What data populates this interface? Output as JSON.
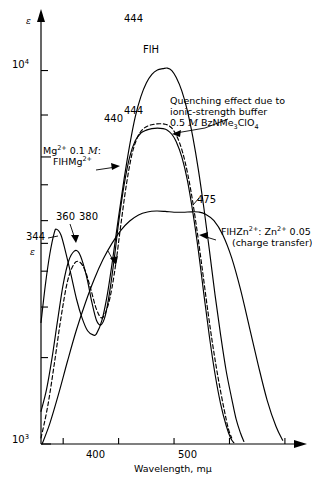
{
  "chart_data": {
    "type": "line",
    "title": "",
    "xlabel": "Wavelength, mμ",
    "ylabel": "ε",
    "scale_y": "log",
    "xlim": [
      330,
      560
    ],
    "ylim": [
      1000,
      30000
    ],
    "grid": false,
    "legend_position": "inline-annotations",
    "x_ticks": [
      350,
      400,
      450,
      500,
      550
    ],
    "x_tick_labels": [
      "",
      "400",
      "",
      "500",
      ""
    ],
    "y_ticks": [
      1000,
      2000,
      3000,
      4000,
      5000,
      6000,
      8000,
      10000,
      14000,
      20000
    ],
    "y_tick_labels": [
      "10³",
      "",
      "",
      "",
      "",
      "",
      "",
      "10⁴",
      "",
      ""
    ],
    "y_axis_top_symbol": "ε",
    "y_label_10_4": "10",
    "y_label_10_4_exp": "4",
    "y_label_10_3": "10",
    "y_label_10_3_exp": "3",
    "series": [
      {
        "name": "FlH",
        "style": "solid",
        "peaks": [
          {
            "label": "344",
            "x": 344,
            "y": 5600
          },
          {
            "label": "444",
            "x": 444,
            "y": 20000
          }
        ],
        "points": [
          [
            330,
            2650
          ],
          [
            334,
            3600
          ],
          [
            338,
            4600
          ],
          [
            342,
            5450
          ],
          [
            344,
            5600
          ],
          [
            348,
            5350
          ],
          [
            352,
            4700
          ],
          [
            357,
            3900
          ],
          [
            362,
            3200
          ],
          [
            367,
            2750
          ],
          [
            372,
            2480
          ],
          [
            377,
            2400
          ],
          [
            380,
            2420
          ],
          [
            385,
            2700
          ],
          [
            390,
            3350
          ],
          [
            395,
            4500
          ],
          [
            400,
            6200
          ],
          [
            405,
            8400
          ],
          [
            410,
            11000
          ],
          [
            415,
            13800
          ],
          [
            420,
            16200
          ],
          [
            425,
            18100
          ],
          [
            430,
            19400
          ],
          [
            435,
            20100
          ],
          [
            440,
            20300
          ],
          [
            444,
            20400
          ],
          [
            448,
            20000
          ],
          [
            452,
            18900
          ],
          [
            457,
            17000
          ],
          [
            462,
            14500
          ],
          [
            467,
            11700
          ],
          [
            472,
            9000
          ],
          [
            477,
            6600
          ],
          [
            482,
            4700
          ],
          [
            487,
            3300
          ],
          [
            492,
            2400
          ],
          [
            497,
            1800
          ],
          [
            502,
            1440
          ],
          [
            506,
            1220
          ],
          [
            510,
            1090
          ],
          [
            513,
            1020
          ]
        ]
      },
      {
        "name": "FlHMg2+",
        "style": "solid",
        "peaks": [
          {
            "label": "360",
            "x": 360,
            "y": 4700
          },
          {
            "label": "380",
            "x": 380,
            "y": 4300
          },
          {
            "label": "440",
            "x": 440,
            "y": 12200
          }
        ],
        "points": [
          [
            330,
            1300
          ],
          [
            335,
            1550
          ],
          [
            340,
            2000
          ],
          [
            345,
            2700
          ],
          [
            350,
            3600
          ],
          [
            355,
            4350
          ],
          [
            360,
            4700
          ],
          [
            364,
            4650
          ],
          [
            368,
            4250
          ],
          [
            372,
            3700
          ],
          [
            376,
            3100
          ],
          [
            380,
            2700
          ],
          [
            384,
            2600
          ],
          [
            388,
            2800
          ],
          [
            392,
            3400
          ],
          [
            396,
            4400
          ],
          [
            400,
            5900
          ],
          [
            405,
            8000
          ],
          [
            410,
            10000
          ],
          [
            415,
            11400
          ],
          [
            420,
            12100
          ],
          [
            425,
            12400
          ],
          [
            430,
            12550
          ],
          [
            435,
            12600
          ],
          [
            440,
            12550
          ],
          [
            444,
            12400
          ],
          [
            448,
            12000
          ],
          [
            452,
            11300
          ],
          [
            457,
            10000
          ],
          [
            462,
            8300
          ],
          [
            467,
            6400
          ],
          [
            472,
            4700
          ],
          [
            477,
            3300
          ],
          [
            482,
            2350
          ],
          [
            487,
            1750
          ],
          [
            492,
            1380
          ],
          [
            497,
            1160
          ],
          [
            501,
            1050
          ],
          [
            504,
            1010
          ]
        ]
      },
      {
        "name": "Quenched (ionic-strength buffer)",
        "style": "dashed",
        "peaks": [
          {
            "label": "444",
            "x": 444,
            "y": 12800
          }
        ],
        "points": [
          [
            330,
            1050
          ],
          [
            336,
            1350
          ],
          [
            342,
            1900
          ],
          [
            348,
            2750
          ],
          [
            354,
            3700
          ],
          [
            360,
            4250
          ],
          [
            365,
            4300
          ],
          [
            370,
            4000
          ],
          [
            375,
            3450
          ],
          [
            380,
            2950
          ],
          [
            385,
            2750
          ],
          [
            390,
            3000
          ],
          [
            394,
            3500
          ],
          [
            398,
            4400
          ],
          [
            402,
            5800
          ],
          [
            407,
            8000
          ],
          [
            412,
            10200
          ],
          [
            417,
            11700
          ],
          [
            422,
            12500
          ],
          [
            427,
            12850
          ],
          [
            432,
            13000
          ],
          [
            437,
            13050
          ],
          [
            442,
            13000
          ],
          [
            446,
            12800
          ],
          [
            450,
            12300
          ],
          [
            455,
            11200
          ],
          [
            460,
            9600
          ],
          [
            465,
            7700
          ],
          [
            470,
            5800
          ],
          [
            475,
            4200
          ],
          [
            480,
            3000
          ],
          [
            485,
            2200
          ],
          [
            490,
            1680
          ],
          [
            495,
            1330
          ],
          [
            499,
            1130
          ],
          [
            502,
            1050
          ]
        ]
      },
      {
        "name": "FlHZn2+ (charge transfer)",
        "style": "solid",
        "peaks": [
          {
            "label": "475",
            "x": 475,
            "y": 6400
          }
        ],
        "points": [
          [
            331,
            1000
          ],
          [
            338,
            1180
          ],
          [
            346,
            1500
          ],
          [
            354,
            1950
          ],
          [
            362,
            2500
          ],
          [
            370,
            3100
          ],
          [
            378,
            3750
          ],
          [
            386,
            4400
          ],
          [
            394,
            5000
          ],
          [
            402,
            5550
          ],
          [
            410,
            5980
          ],
          [
            418,
            6280
          ],
          [
            426,
            6430
          ],
          [
            434,
            6480
          ],
          [
            442,
            6460
          ],
          [
            450,
            6420
          ],
          [
            458,
            6420
          ],
          [
            466,
            6440
          ],
          [
            472,
            6430
          ],
          [
            478,
            6330
          ],
          [
            486,
            6000
          ],
          [
            494,
            5350
          ],
          [
            502,
            4450
          ],
          [
            510,
            3450
          ],
          [
            518,
            2550
          ],
          [
            526,
            1880
          ],
          [
            534,
            1420
          ],
          [
            542,
            1150
          ],
          [
            548,
            1030
          ]
        ]
      }
    ],
    "annotations": [
      {
        "id": "quenching",
        "lines": [
          "Quenching effect due to",
          "ionic-strength buffer",
          "0.5 M BzNMe₃ClO₄"
        ],
        "molar_symbol": "M",
        "prefix": "0.5 ",
        "formula": " BzNMe",
        "formula_sub": "3",
        "formula_tail": "ClO",
        "formula_sub2": "4"
      },
      {
        "id": "magnesium",
        "line1_a": "Mg",
        "line1_sup": "2+",
        "line1_b": " 0.1 ",
        "line1_ital": "M",
        "line1_c": ":",
        "line2_a": "FlHMg",
        "line2_sup": "2+"
      },
      {
        "id": "zinc",
        "line1_a": "FlHZn",
        "line1_sup": "2+",
        "line1_b": ": Zn",
        "line1_sup2": "2+",
        "line1_c": " 0.05 ",
        "line1_ital": "M",
        "line2": "(charge transfer)"
      },
      {
        "id": "flh-curve-label",
        "text": "FlH"
      }
    ],
    "peak_labels": [
      "444",
      "440",
      "444",
      "475",
      "344",
      "360",
      "380"
    ]
  }
}
